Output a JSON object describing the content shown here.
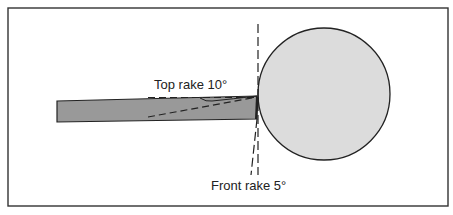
{
  "diagram": {
    "labels": {
      "top_rake": "Top rake 10°",
      "front_rake": "Front rake 5°"
    },
    "colors": {
      "background": "#ffffff",
      "frame": "#333333",
      "tool_fill": "#999999",
      "workpiece_fill": "#dcdcdc",
      "stroke": "#222222"
    },
    "elements": {
      "tool": "cutting-tool bar",
      "workpiece": "round workpiece",
      "top_rake_reference": "horizontal dashed reference line",
      "top_rake_angle_line": "angled dashed line",
      "front_rake_reference": "vertical dashed reference line",
      "front_rake_angle_line": "angled dashed line"
    }
  }
}
